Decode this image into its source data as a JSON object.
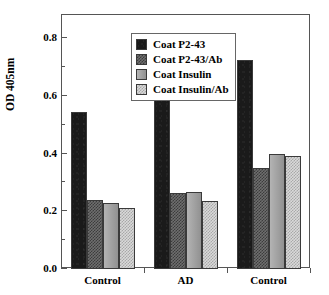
{
  "chart_data": {
    "type": "bar",
    "title": "",
    "subtitle": "",
    "xlabel": "",
    "ylabel": "OD 405nm",
    "categories": [
      "Control",
      "AD",
      "Control"
    ],
    "series": [
      {
        "name": "Coat P2-43",
        "values": [
          0.545,
          0.59,
          0.725
        ],
        "pattern": "solid-black",
        "color": "#1a1a1a"
      },
      {
        "name": "Coat P2-43/Ab",
        "values": [
          0.24,
          0.262,
          0.35
        ],
        "pattern": "dark-check",
        "color": "#6e6e6e"
      },
      {
        "name": "Coat Insulin",
        "values": [
          0.228,
          0.268,
          0.4
        ],
        "pattern": "solid-gray",
        "color": "#9a9a9a"
      },
      {
        "name": "Coat Insulin/Ab",
        "values": [
          0.212,
          0.237,
          0.393
        ],
        "pattern": "light-check",
        "color": "#d9d9d9"
      }
    ],
    "ylim": [
      0.0,
      0.88
    ],
    "yticks": [
      "0.0",
      "0.2",
      "0.4",
      "0.6",
      "0.8"
    ],
    "ytick_values": [
      0.0,
      0.2,
      0.4,
      0.6,
      0.8
    ],
    "yminor_values": [
      0.1,
      0.3,
      0.5,
      0.7
    ],
    "grid": false,
    "legend_position": "top-left",
    "legend_entries": [
      "Coat P2-43",
      "Coat P2-43/Ab",
      "Coat Insulin",
      "Coat Insulin/Ab"
    ]
  },
  "axis": {
    "y_title": "OD 405nm",
    "y_labels": [
      "0.8",
      "0.6",
      "0.4",
      "0.2",
      "0.0"
    ],
    "x_labels": [
      "Control",
      "AD",
      "Control"
    ]
  },
  "legend": {
    "items": [
      {
        "label": "Coat P2-43"
      },
      {
        "label": "Coat P2-43/Ab"
      },
      {
        "label": "Coat Insulin"
      },
      {
        "label": "Coat Insulin/Ab"
      }
    ]
  }
}
